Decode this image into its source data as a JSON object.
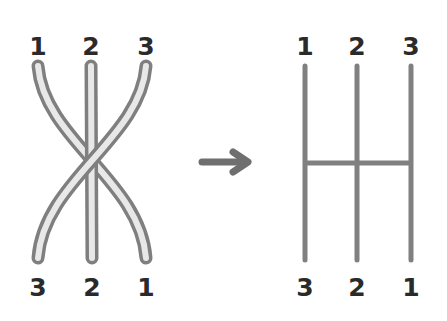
{
  "diagram": {
    "left_panel": {
      "name": "braided-strands",
      "top_labels": [
        "1",
        "2",
        "3"
      ],
      "bottom_labels": [
        "3",
        "2",
        "1"
      ],
      "strand_fill": "#e8e8e8",
      "strand_outline": "#7f7f7f"
    },
    "arrow": {
      "direction": "right",
      "color": "#6f6f6f"
    },
    "right_panel": {
      "name": "ladder-lines",
      "top_labels": [
        "1",
        "2",
        "3"
      ],
      "bottom_labels": [
        "3",
        "2",
        "1"
      ],
      "line_color": "#808080"
    }
  }
}
